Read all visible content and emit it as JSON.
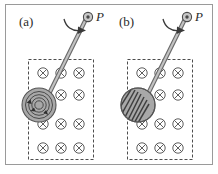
{
  "figure": {
    "width": 218,
    "height": 174,
    "background_color": "#ffffff",
    "frame": {
      "name": "figure-border",
      "x": 5,
      "y": 4,
      "width": 208,
      "height": 161,
      "stroke": "#9a9a9a",
      "stroke_width": 1
    }
  },
  "panels": [
    {
      "id": "a",
      "label": "(a)",
      "label_x": 19,
      "label_y": 24,
      "disk_type": "solid-disk-with-eddy-currents",
      "field_region": {
        "x": 28,
        "y": 59,
        "width": 66,
        "height": 101,
        "stroke": "#4d4d4d",
        "dash": "3 2"
      },
      "field_symbol": "cross-in-circle",
      "field_symbol_name": "magnetic-field-into-page",
      "field_rows": 4,
      "field_cols": 3,
      "pivot": {
        "x": 88,
        "y": 17,
        "label": "P",
        "label_x": 96,
        "label_y": 18
      },
      "rod": {
        "x1": 86,
        "y1": 19,
        "x2": 47,
        "y2": 101
      },
      "disk": {
        "cx": 39,
        "cy": 105,
        "r": 17,
        "fill": "#a8a8a8",
        "stroke": "#555555"
      },
      "eddy_rings": [
        14,
        11,
        8,
        5
      ],
      "rotation_arrow": "curved-arrow-clockwise"
    },
    {
      "id": "b",
      "label": "(b)",
      "label_x": 119,
      "label_y": 24,
      "disk_type": "slotted-disk",
      "field_region": {
        "x": 127,
        "y": 59,
        "width": 66,
        "height": 101,
        "stroke": "#4d4d4d",
        "dash": "3 2"
      },
      "field_symbol": "cross-in-circle",
      "field_symbol_name": "magnetic-field-into-page",
      "field_rows": 4,
      "field_cols": 3,
      "pivot": {
        "x": 187,
        "y": 17,
        "label": "P",
        "label_x": 195,
        "label_y": 18
      },
      "rod": {
        "x1": 185,
        "y1": 19,
        "x2": 146,
        "y2": 101
      },
      "disk": {
        "cx": 138,
        "cy": 105,
        "r": 17,
        "fill": "#a8a8a8",
        "stroke": "#555555"
      },
      "slot_count": 8,
      "rotation_arrow": "curved-arrow-clockwise"
    }
  ],
  "colors": {
    "rod_fill": "#a0a0a0",
    "rod_stroke": "#6b6b6b",
    "disk_fill": "#a8a8a8",
    "disk_stroke": "#555555",
    "eddy_stroke": "#4a4a4a",
    "field_stroke": "#4d4d4d",
    "dash_stroke": "#4d4d4d",
    "text": "#2b2b2b",
    "frame": "#9a9a9a"
  }
}
